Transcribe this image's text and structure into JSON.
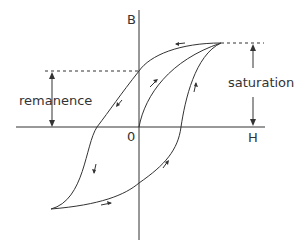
{
  "diagram": {
    "axes": {
      "y_label": "B",
      "x_label": "H",
      "origin_label": "0"
    },
    "annotations": {
      "remanence": "remanence",
      "saturation": "saturation"
    },
    "colors": {
      "line": "#333333",
      "background": "#ffffff"
    }
  }
}
